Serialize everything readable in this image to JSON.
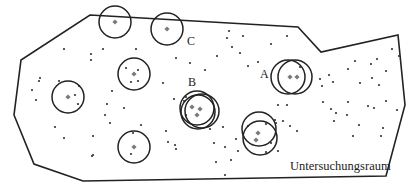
{
  "diagram": {
    "title": "Untersuchungsraum",
    "colors": {
      "outline": "#222222",
      "circle": "#222222",
      "center_marker": "#7a7a7a",
      "point": "#333333",
      "background": "#ffffff"
    },
    "boundary_polygon": [
      [
        90,
        15
      ],
      [
        298,
        27
      ],
      [
        321,
        52
      ],
      [
        398,
        35
      ],
      [
        405,
        105
      ],
      [
        386,
        176
      ],
      [
        83,
        181
      ],
      [
        34,
        164
      ],
      [
        14,
        115
      ],
      [
        21,
        60
      ]
    ],
    "labels": [
      {
        "id": "A",
        "text": "A",
        "x": 260,
        "y": 68
      },
      {
        "id": "B",
        "text": "B",
        "x": 188,
        "y": 76
      },
      {
        "id": "C",
        "text": "C",
        "x": 187,
        "y": 35
      },
      {
        "id": "area",
        "text": "Untersuchungsraum",
        "x": 290,
        "y": 160
      }
    ],
    "sample_circles": [
      {
        "group": "",
        "cx": 115,
        "cy": 22,
        "r": 16
      },
      {
        "group": "C",
        "cx": 167,
        "cy": 29,
        "r": 16
      },
      {
        "group": "",
        "cx": 134,
        "cy": 74,
        "r": 16
      },
      {
        "group": "",
        "cx": 68,
        "cy": 97,
        "r": 16
      },
      {
        "group": "",
        "cx": 134,
        "cy": 147,
        "r": 16
      },
      {
        "group": "B",
        "cx": 197,
        "cy": 108,
        "r": 17
      },
      {
        "group": "B",
        "cx": 198,
        "cy": 112,
        "r": 17
      },
      {
        "group": "B",
        "cx": 202,
        "cy": 111,
        "r": 17
      },
      {
        "group": "A",
        "cx": 288,
        "cy": 77,
        "r": 17
      },
      {
        "group": "A",
        "cx": 295,
        "cy": 77,
        "r": 17
      },
      {
        "group": "",
        "cx": 259,
        "cy": 129,
        "r": 17
      },
      {
        "group": "",
        "cx": 260,
        "cy": 138,
        "r": 17
      }
    ],
    "center_markers": [
      [
        115,
        22
      ],
      [
        167,
        29
      ],
      [
        134,
        74
      ],
      [
        68,
        97
      ],
      [
        134,
        147
      ],
      [
        192,
        107
      ],
      [
        200,
        109
      ],
      [
        197,
        115
      ],
      [
        290,
        77
      ],
      [
        297,
        77
      ],
      [
        258,
        133
      ],
      [
        256,
        140
      ]
    ],
    "points": [
      [
        64,
        49
      ],
      [
        91,
        54
      ],
      [
        91,
        60
      ],
      [
        103,
        49
      ],
      [
        136,
        49
      ],
      [
        176,
        58
      ],
      [
        190,
        63
      ],
      [
        205,
        70
      ],
      [
        217,
        56
      ],
      [
        248,
        66
      ],
      [
        240,
        53
      ],
      [
        232,
        47
      ],
      [
        227,
        38
      ],
      [
        243,
        36
      ],
      [
        229,
        31
      ],
      [
        258,
        62
      ],
      [
        271,
        44
      ],
      [
        287,
        36
      ],
      [
        79,
        86
      ],
      [
        75,
        95
      ],
      [
        78,
        104
      ],
      [
        59,
        81
      ],
      [
        39,
        81
      ],
      [
        32,
        90
      ],
      [
        36,
        100
      ],
      [
        40,
        78
      ],
      [
        126,
        68
      ],
      [
        138,
        70
      ],
      [
        138,
        81
      ],
      [
        112,
        91
      ],
      [
        163,
        83
      ],
      [
        131,
        82
      ],
      [
        55,
        127
      ],
      [
        64,
        138
      ],
      [
        93,
        136
      ],
      [
        92,
        156
      ],
      [
        93,
        155
      ],
      [
        107,
        104
      ],
      [
        105,
        115
      ],
      [
        124,
        108
      ],
      [
        110,
        123
      ],
      [
        133,
        133
      ],
      [
        131,
        154
      ],
      [
        141,
        125
      ],
      [
        166,
        131
      ],
      [
        175,
        145
      ],
      [
        176,
        149
      ],
      [
        168,
        142
      ],
      [
        186,
        115
      ],
      [
        174,
        99
      ],
      [
        184,
        101
      ],
      [
        186,
        97
      ],
      [
        210,
        129
      ],
      [
        223,
        127
      ],
      [
        214,
        143
      ],
      [
        225,
        147
      ],
      [
        216,
        162
      ],
      [
        225,
        175
      ],
      [
        231,
        160
      ],
      [
        236,
        139
      ],
      [
        238,
        151
      ],
      [
        248,
        126
      ],
      [
        266,
        124
      ],
      [
        276,
        123
      ],
      [
        266,
        152
      ],
      [
        271,
        143
      ],
      [
        278,
        151
      ],
      [
        283,
        121
      ],
      [
        290,
        126
      ],
      [
        297,
        131
      ],
      [
        278,
        105
      ],
      [
        287,
        105
      ],
      [
        275,
        120
      ],
      [
        320,
        79
      ],
      [
        322,
        86
      ],
      [
        323,
        102
      ],
      [
        331,
        109
      ],
      [
        334,
        121
      ],
      [
        347,
        115
      ],
      [
        359,
        125
      ],
      [
        368,
        106
      ],
      [
        386,
        101
      ],
      [
        374,
        108
      ],
      [
        383,
        128
      ],
      [
        381,
        136
      ],
      [
        397,
        110
      ],
      [
        353,
        136
      ],
      [
        336,
        113
      ],
      [
        348,
        102
      ],
      [
        360,
        83
      ],
      [
        355,
        61
      ],
      [
        372,
        78
      ],
      [
        379,
        85
      ],
      [
        333,
        82
      ],
      [
        300,
        67
      ],
      [
        329,
        75
      ],
      [
        348,
        69
      ],
      [
        371,
        64
      ],
      [
        392,
        49
      ],
      [
        377,
        59
      ],
      [
        386,
        71
      ],
      [
        399,
        56
      ]
    ]
  }
}
